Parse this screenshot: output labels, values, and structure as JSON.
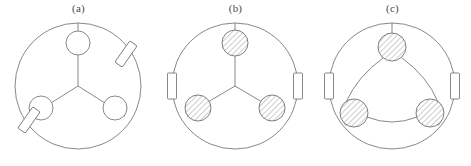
{
  "figure": {
    "title": "",
    "background_color": "#ffffff",
    "line_color": "#7b7b7b",
    "hatch_color": "#6f6f6f",
    "width": 471,
    "height": 166,
    "panel_count": 3
  },
  "panels": [
    {
      "id": "a",
      "label": "(a)",
      "outer_circle": {
        "cx": 78,
        "cy": 70,
        "r": 63
      },
      "hub": {
        "cx": 78,
        "cy": 70
      },
      "nodes": [
        {
          "name": "top-node",
          "cx": 78,
          "cy": 27,
          "r": 12,
          "style": "open"
        },
        {
          "name": "lower-left-node",
          "cx": 41,
          "cy": 92,
          "r": 12,
          "style": "open"
        },
        {
          "name": "lower-right-node",
          "cx": 115,
          "cy": 92,
          "r": 12,
          "style": "open"
        }
      ],
      "rim_parts": [
        {
          "name": "upper-right-rim-part",
          "cx": 126,
          "cy": 38,
          "w": 9,
          "h": 26,
          "rotation": 35
        },
        {
          "name": "lower-left-rim-part",
          "cx": 29,
          "cy": 104,
          "w": 9,
          "h": 26,
          "rotation": 35
        }
      ],
      "stub": {
        "x1": 78,
        "y1": 15,
        "x2": 78,
        "y2": 7
      }
    },
    {
      "id": "b",
      "label": "(b)",
      "outer_circle": {
        "cx": 78,
        "cy": 70,
        "r": 63
      },
      "hub": {
        "cx": 78,
        "cy": 70
      },
      "nodes": [
        {
          "name": "top-node",
          "cx": 78,
          "cy": 27,
          "r": 13,
          "style": "hatched"
        },
        {
          "name": "lower-left-node",
          "cx": 41,
          "cy": 92,
          "r": 13,
          "style": "hatched"
        },
        {
          "name": "lower-right-node",
          "cx": 115,
          "cy": 92,
          "r": 13,
          "style": "hatched"
        }
      ],
      "rim_parts": [
        {
          "name": "left-rim-part",
          "cx": 15,
          "cy": 70,
          "w": 9,
          "h": 26,
          "rotation": 0
        },
        {
          "name": "right-rim-part",
          "cx": 141,
          "cy": 70,
          "w": 9,
          "h": 26,
          "rotation": 0
        }
      ],
      "stub": {
        "x1": 78,
        "y1": 14,
        "x2": 78,
        "y2": 7
      }
    },
    {
      "id": "c",
      "label": "(c)",
      "outer_circle": {
        "cx": 78,
        "cy": 70,
        "r": 63
      },
      "nodes": [
        {
          "name": "top-node",
          "cx": 78,
          "cy": 31,
          "r": 14,
          "style": "hatched"
        },
        {
          "name": "lower-left-node",
          "cx": 40,
          "cy": 97,
          "r": 14,
          "style": "hatched"
        },
        {
          "name": "lower-right-node",
          "cx": 116,
          "cy": 97,
          "r": 14,
          "style": "hatched"
        }
      ],
      "rim_parts": [
        {
          "name": "left-rim-part",
          "cx": 15,
          "cy": 70,
          "w": 9,
          "h": 26,
          "rotation": 0
        },
        {
          "name": "right-rim-part",
          "cx": 141,
          "cy": 70,
          "w": 9,
          "h": 26,
          "rotation": 0
        }
      ],
      "stub": {
        "x1": 78,
        "y1": 17,
        "x2": 78,
        "y2": 7
      },
      "connection_style": "curved-delta-arcs"
    }
  ]
}
